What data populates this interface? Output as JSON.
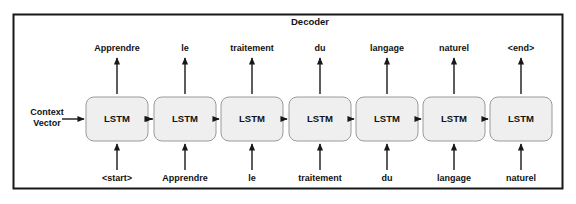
{
  "diagram": {
    "title": "Decoder",
    "context_label_line1": "Context",
    "context_label_line2": "Vector",
    "cell_label": "LSTM",
    "cells": [
      {
        "cell": "LSTM",
        "output": "Apprendre",
        "input": "<start>"
      },
      {
        "cell": "LSTM",
        "output": "le",
        "input": "Apprendre"
      },
      {
        "cell": "LSTM",
        "output": "traitement",
        "input": "le"
      },
      {
        "cell": "LSTM",
        "output": "du",
        "input": "traitement"
      },
      {
        "cell": "LSTM",
        "output": "langage",
        "input": "du"
      },
      {
        "cell": "LSTM",
        "output": "naturel",
        "input": "langage"
      },
      {
        "cell": "LSTM",
        "output": "<end>",
        "input": "naturel"
      }
    ],
    "colors": {
      "frame_stroke": "#17181a",
      "cell_fill": "#efefef",
      "cell_stroke": "#9a9a9a",
      "arrow": "#17181a",
      "text": "#111213",
      "background": "#ffffff"
    }
  }
}
